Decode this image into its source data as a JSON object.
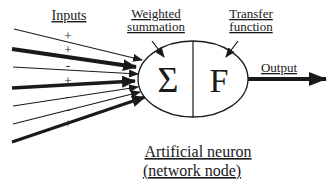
{
  "diagram": {
    "title_line1": "Artificial neuron",
    "title_line2": "(network node)",
    "inputs_label": "Inputs",
    "weighted_label_line1": "Weighted",
    "weighted_label_line2": "summation",
    "transfer_label_line1": "Transfer",
    "transfer_label_line2": "function",
    "output_label": "Output",
    "sigma_symbol": "Σ",
    "function_symbol": "F",
    "input_signs": [
      "+",
      "+",
      "-",
      "+",
      "-",
      "-",
      "+"
    ],
    "colors": {
      "ink": "#1a1a1a",
      "background": "#ffffff"
    }
  }
}
